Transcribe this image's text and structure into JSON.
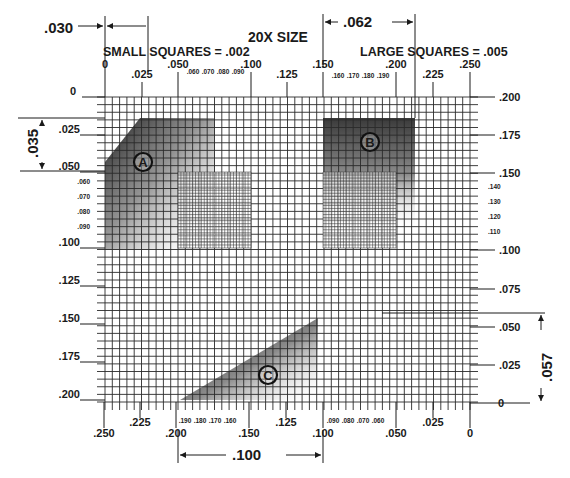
{
  "title": "20X SIZE",
  "notes": {
    "small_squares": "SMALL SQUARES = .002",
    "large_squares": "LARGE SQUARES = .005"
  },
  "dimensions": {
    "top_left": ".030",
    "top_right": ".062",
    "left_vertical": ".035",
    "right_vertical": ".057",
    "bottom": ".100"
  },
  "markers": {
    "a": "A",
    "b": "B",
    "c": "C"
  },
  "top_axis": {
    "major": [
      {
        "label": "0",
        "x": 105
      },
      {
        "label": ".025",
        "x": 142
      },
      {
        "label": ".050",
        "x": 178
      },
      {
        "label": ".100",
        "x": 251
      },
      {
        "label": ".125",
        "x": 287
      },
      {
        "label": ".150",
        "x": 323
      },
      {
        "label": ".200",
        "x": 396
      },
      {
        "label": ".225",
        "x": 433
      },
      {
        "label": ".250",
        "x": 470
      }
    ],
    "minor_left": [
      ".060",
      ".070",
      ".080",
      ".090"
    ],
    "minor_right": [
      ".160",
      ".170",
      ".180",
      ".190"
    ]
  },
  "left_axis": {
    "major": [
      {
        "label": "0",
        "y": 97
      },
      {
        "label": ".025",
        "y": 135
      },
      {
        "label": ".050",
        "y": 172
      },
      {
        "label": ".100",
        "y": 248
      },
      {
        "label": ".125",
        "y": 286
      },
      {
        "label": ".150",
        "y": 324
      },
      {
        "label": ".175",
        "y": 362
      },
      {
        "label": ".200",
        "y": 400
      }
    ],
    "minor": [
      ".060",
      ".070",
      ".080",
      ".090"
    ]
  },
  "right_axis": {
    "major": [
      {
        "label": ".200",
        "y": 97
      },
      {
        "label": ".175",
        "y": 135
      },
      {
        "label": ".150",
        "y": 173
      },
      {
        "label": ".100",
        "y": 250
      },
      {
        "label": ".075",
        "y": 289
      },
      {
        "label": ".050",
        "y": 327
      },
      {
        "label": ".025",
        "y": 365
      },
      {
        "label": "0",
        "y": 403
      }
    ],
    "minor": [
      ".140",
      ".130",
      ".120",
      ".110"
    ]
  },
  "bottom_axis": {
    "major": [
      {
        "label": ".250",
        "x": 104
      },
      {
        "label": ".225",
        "x": 140
      },
      {
        "label": ".200",
        "x": 176
      },
      {
        "label": ".150",
        "x": 249
      },
      {
        "label": ".125",
        "x": 286
      },
      {
        "label": ".100",
        "x": 323
      },
      {
        "label": ".050",
        "x": 396
      },
      {
        "label": ".025",
        "x": 433
      },
      {
        "label": "0",
        "x": 470
      }
    ],
    "minor_left": [
      ".190",
      ".180",
      ".170",
      ".160"
    ],
    "minor_right": [
      ".090",
      ".080",
      ".070",
      ".060"
    ]
  },
  "colors": {
    "ink": "#1a1a1a",
    "grid": "#2a2a2a",
    "fill_dark": "#303030",
    "paper": "#ffffff"
  }
}
